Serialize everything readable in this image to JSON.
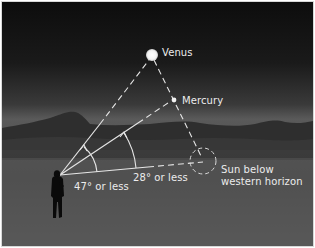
{
  "diagram": {
    "title": "",
    "labels": {
      "venus": "Venus",
      "mercury": "Mercury",
      "sun_line1": "Sun below",
      "sun_line2": "western horizon",
      "angle_venus": "47° or less",
      "angle_mercury": "28° or less"
    },
    "elements": {
      "observer": "observer-silhouette",
      "sun": "dashed-circle-below-horizon",
      "venus": "bright-filled-circle",
      "mercury": "small-filled-dot"
    },
    "angles": [
      {
        "target": "Venus",
        "max_elongation_deg": 47,
        "label": "47° or less"
      },
      {
        "target": "Mercury",
        "max_elongation_deg": 28,
        "label": "28° or less"
      }
    ],
    "colors": {
      "sky_top": "#0d0d0d",
      "mountains": "#2a2a2a",
      "ground": "#5a5a5a",
      "lines": "#e8e8e8",
      "text": "#ececec",
      "frame": "#d8d8d8"
    }
  }
}
